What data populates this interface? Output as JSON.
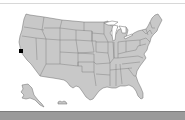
{
  "map": {
    "title": "",
    "region": "United States",
    "fill_color": "#c8c8c8",
    "border_color": "#6a6a6a",
    "background": "#ffffff",
    "marker": {
      "shape": "square",
      "color": "#000000",
      "location_hint": "Northern California coast (San Francisco Bay Area)",
      "x": 21,
      "y": 51
    }
  },
  "footer": {
    "bar_color": "#9a9a9a"
  }
}
